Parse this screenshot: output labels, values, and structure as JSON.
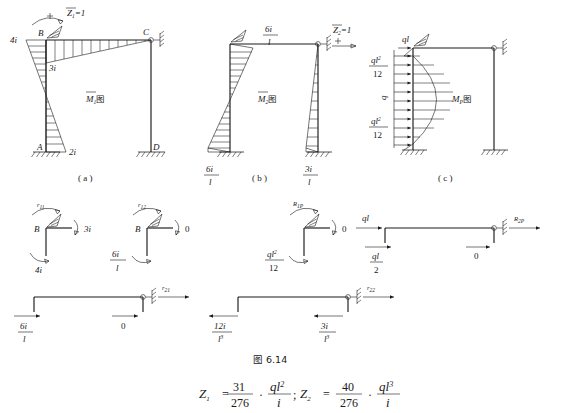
{
  "figure": {
    "number": "图 6.14",
    "caption_a": "( a )",
    "caption_b": "( b )",
    "caption_c": "( c )"
  },
  "panel_a": {
    "title": "图",
    "title_sym": "M",
    "title_sub": "1",
    "applied": {
      "sym": "Z",
      "sub": "1",
      "eq": "=1"
    },
    "nodes": {
      "b": "B",
      "c": "C",
      "a": "A",
      "d": "D"
    },
    "values": {
      "left_top": "4i",
      "below_b": "3i",
      "bottom": "2i"
    }
  },
  "panel_b": {
    "title": "图",
    "title_sym": "M",
    "title_sub": "2",
    "applied": {
      "sym": "Z",
      "sub": "2",
      "eq": "=1"
    },
    "values": {
      "beam_num": "6i",
      "beam_den": "l",
      "left_base_num": "6i",
      "left_base_den": "l",
      "right_base_num": "3i",
      "right_base_den": "l"
    }
  },
  "panel_c": {
    "title": "图",
    "title_sym": "M",
    "title_sub": "P",
    "values": {
      "top_load": "ql",
      "top_num": "ql",
      "top_num_sup": "2",
      "top_den": "12",
      "mid_load": "q",
      "bot_num": "ql",
      "bot_num_sup": "2",
      "bot_den": "12"
    }
  },
  "joint_r11": {
    "label_sym": "r",
    "label_sub": "11",
    "node": "B",
    "right": "3i",
    "bottom": "4i"
  },
  "joint_r12": {
    "label_sym": "r",
    "label_sub": "12",
    "node": "B",
    "right": "0",
    "bottom_num": "6i",
    "bottom_den": "l"
  },
  "joint_r1p": {
    "label_sym": "R",
    "label_sub": "1P",
    "right": "0",
    "bottom_num": "ql",
    "bottom_num_sup": "2",
    "bottom_den": "12"
  },
  "frame_r21": {
    "label_sym": "r",
    "label_sub": "21",
    "left_num": "6i",
    "left_den": "l",
    "mid": "0"
  },
  "frame_r22": {
    "label_sym": "r",
    "label_sub": "22",
    "left_num": "12i",
    "left_den": "l",
    "left_den_sup": "3",
    "right_num": "3i",
    "right_den": "l",
    "right_den_sup": "3"
  },
  "frame_r2p": {
    "label_sym": "R",
    "label_sub": "2P",
    "top_load": "ql",
    "left_num": "ql",
    "left_den": "2",
    "mid": "0"
  },
  "equation": {
    "z1_sym": "Z",
    "z1_sub": "1",
    "eq1": "=",
    "n1": "31",
    "d1": "276",
    "dot1": "·",
    "f1_num": "ql",
    "f1_sup": "2",
    "f1_den": "i",
    "sep": ";",
    "z2_sym": "Z",
    "z2_sub": "2",
    "eq2": "=",
    "n2": "40",
    "d2": "276",
    "dot2": "·",
    "f2_num": "ql",
    "f2_sup": "3",
    "f2_den": "i"
  }
}
